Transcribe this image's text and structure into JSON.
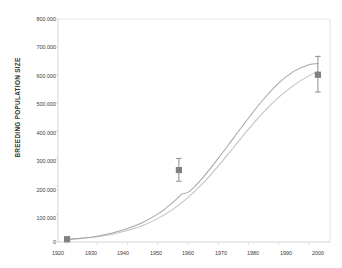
{
  "chart_data": {
    "type": "line",
    "title": "",
    "xlabel": "",
    "ylabel": "BREEDING POPULATION SIZE",
    "xlim": [
      1917,
      2007
    ],
    "ylim": [
      0,
      800000
    ],
    "grid": false,
    "legend": "none",
    "y_ticks": [
      0,
      100000,
      200000,
      300000,
      400000,
      500000,
      600000,
      700000,
      800000
    ],
    "y_tick_labels": [
      "0",
      "100.000",
      "200.000",
      "300.000",
      "400.000",
      "500.000",
      "600.000",
      "700.000",
      "800.000"
    ],
    "x_ticks": [
      1920,
      1930,
      1940,
      1950,
      1960,
      1970,
      1980,
      1990,
      2000
    ],
    "x_tick_labels": [
      "1920",
      "1930",
      "1940",
      "1950",
      "1960",
      "1970",
      "1980",
      "1990",
      "2000"
    ],
    "series": [
      {
        "name": "modelled-curve-light",
        "color": "#c2c2c2",
        "x": [
          1920,
          1925,
          1930,
          1935,
          1940,
          1945,
          1950,
          1955,
          1960,
          1965,
          1970,
          1975,
          1980,
          1985,
          1990,
          1995,
          2000,
          2003
        ],
        "values": [
          9000,
          13000,
          19000,
          28000,
          41000,
          59000,
          84000,
          117000,
          159000,
          211000,
          272000,
          338000,
          404000,
          466000,
          519000,
          562000,
          596000,
          612000
        ]
      },
      {
        "name": "modelled-curve-dark",
        "color": "#a8a8a8",
        "x": [
          1920,
          1925,
          1930,
          1935,
          1940,
          1945,
          1950,
          1953,
          1956,
          1958,
          1960,
          1962,
          1965,
          1970,
          1975,
          1980,
          1985,
          1990,
          1995,
          2000,
          2003
        ],
        "values": [
          9000,
          14000,
          21000,
          32000,
          48000,
          70000,
          100000,
          124000,
          152000,
          172000,
          178000,
          196000,
          232000,
          300000,
          372000,
          444000,
          512000,
          570000,
          612000,
          636000,
          640000
        ]
      }
    ],
    "points": [
      {
        "name": "estimate-1920",
        "x": 1920,
        "y": 10000,
        "err_low": 4000,
        "err_high": 4000,
        "marker": "square",
        "color": "#808080"
      },
      {
        "name": "estimate-1957",
        "x": 1957,
        "y": 258000,
        "err_low": 40000,
        "err_high": 42000,
        "marker": "square",
        "color": "#808080"
      },
      {
        "name": "estimate-2003",
        "x": 2003,
        "y": 600000,
        "err_low": 62000,
        "err_high": 66000,
        "marker": "square",
        "color": "#808080"
      }
    ]
  },
  "colors": {
    "curve_light": "#c2c2c2",
    "curve_dark": "#a8a8a8",
    "marker": "#808080",
    "axis": "#d0d0d0",
    "text": "#3a3a3a",
    "background": "#ffffff"
  }
}
